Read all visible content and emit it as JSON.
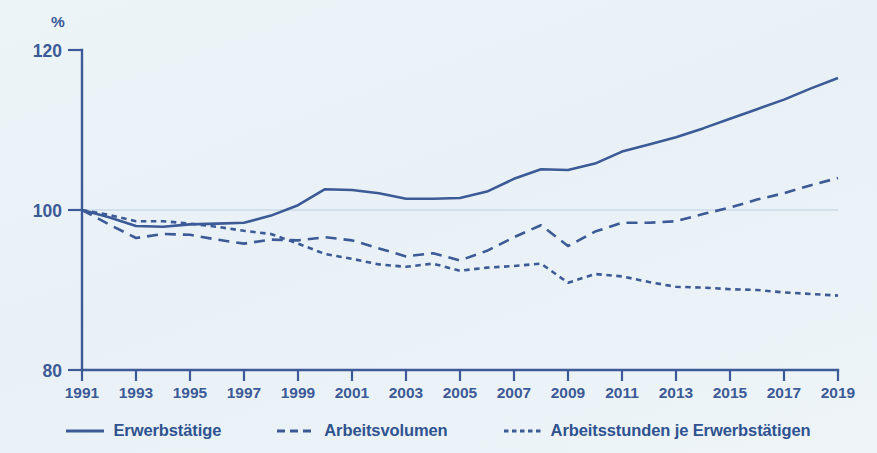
{
  "chart_data": {
    "type": "line",
    "title": "",
    "subtitle": "",
    "xlabel": "",
    "ylabel": "%",
    "ylim": [
      80,
      120
    ],
    "xlim": [
      1991,
      2019
    ],
    "yticks": [
      "80",
      "100",
      "120"
    ],
    "grid": "horizontal-reference-at-100",
    "legend_position": "bottom-center",
    "index_base": "1991 = 100",
    "x": [
      1991,
      1992,
      1993,
      1994,
      1995,
      1996,
      1997,
      1998,
      1999,
      2000,
      2001,
      2002,
      2003,
      2004,
      2005,
      2006,
      2007,
      2008,
      2009,
      2010,
      2011,
      2012,
      2013,
      2014,
      2015,
      2016,
      2017,
      2018,
      2019
    ],
    "xtick_labels": [
      "1991",
      "1993",
      "1995",
      "1997",
      "1999",
      "2001",
      "2003",
      "2005",
      "2007",
      "2009",
      "2011",
      "2013",
      "2015",
      "2017",
      "2019"
    ],
    "series": [
      {
        "name": "Erwerbstätige",
        "style": "solid",
        "color": "#3c5a96",
        "values": [
          100.0,
          99.1,
          98.0,
          97.9,
          98.2,
          98.3,
          98.4,
          99.3,
          100.6,
          102.6,
          102.5,
          102.1,
          101.4,
          101.4,
          101.5,
          102.3,
          103.9,
          105.1,
          105.0,
          105.8,
          107.3,
          108.2,
          109.1,
          110.2,
          111.4,
          112.6,
          113.8,
          115.2,
          116.5
        ]
      },
      {
        "name": "Arbeitsvolumen",
        "style": "dashed",
        "color": "#3c5a96",
        "values": [
          100.0,
          98.2,
          96.5,
          97.0,
          96.9,
          96.3,
          95.8,
          96.3,
          96.2,
          96.6,
          96.2,
          95.2,
          94.2,
          94.6,
          93.7,
          94.9,
          96.6,
          98.1,
          95.5,
          97.3,
          98.4,
          98.4,
          98.6,
          99.5,
          100.3,
          101.3,
          102.1,
          103.1,
          104.0
        ]
      },
      {
        "name": "Arbeitsstunden je Erwerbstätigen",
        "style": "dotted",
        "color": "#3c5a96",
        "values": [
          100.0,
          99.4,
          98.6,
          98.6,
          98.3,
          97.9,
          97.4,
          97.0,
          95.8,
          94.5,
          93.9,
          93.2,
          92.9,
          93.3,
          92.4,
          92.8,
          93.0,
          93.3,
          90.9,
          92.0,
          91.7,
          91.0,
          90.4,
          90.3,
          90.1,
          90.0,
          89.7,
          89.5,
          89.3
        ]
      }
    ]
  },
  "axis": {
    "y_unit_label": "%",
    "y_tick_top": "120",
    "y_tick_mid": "100",
    "y_tick_bottom": "80"
  },
  "legend": {
    "items": [
      {
        "label": "Erwerbstätige",
        "style": "solid"
      },
      {
        "label": "Arbeitsvolumen",
        "style": "dashed"
      },
      {
        "label": "Arbeitsstunden je Erwerbstätigen",
        "style": "dotted"
      }
    ]
  },
  "colors": {
    "accent": "#3c5a96",
    "background": "#eef4f7",
    "gridline": "#b9cfe2"
  }
}
